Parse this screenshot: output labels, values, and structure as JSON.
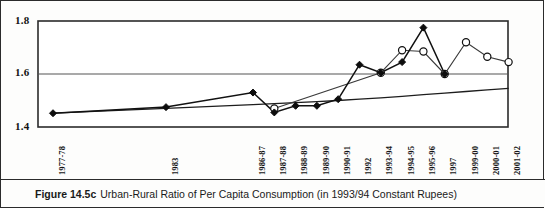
{
  "caption": {
    "figure_number": "Figure 14.5c",
    "text": "Urban-Rural Ratio of Per Capita Consumption (in 1993/94 Constant Rupees)"
  },
  "chart_data": {
    "type": "line",
    "title": "Urban-Rural Ratio of Per Capita Consumption (in 1993/94 Constant Rupees)",
    "xlabel": "",
    "ylabel": "",
    "ylim": [
      1.4,
      1.8
    ],
    "yticks": [
      1.4,
      1.6,
      1.8
    ],
    "ytick_labels": [
      "1.4",
      "1.6",
      "1.8"
    ],
    "grid": true,
    "legend": "none",
    "categories": [
      "1977-78",
      "1983",
      "1986-87",
      "1987-88",
      "1988-89",
      "1989-90",
      "1990-91",
      "1992",
      "1993-94",
      "1994-95",
      "1995-96",
      "1997",
      "1999-00",
      "2000-01",
      "2001-02"
    ],
    "series": [
      {
        "name": "Urban-Rural ratio (filled diamond)",
        "marker": "filled-diamond",
        "values": [
          1.452,
          1.475,
          1.53,
          1.455,
          1.48,
          1.48,
          1.505,
          1.635,
          1.605,
          1.645,
          1.775,
          1.6,
          null,
          null,
          null
        ]
      },
      {
        "name": "Urban-Rural ratio (open circle)",
        "marker": "open-circle",
        "values": [
          null,
          null,
          null,
          1.47,
          null,
          null,
          null,
          null,
          1.605,
          1.69,
          1.685,
          1.6,
          1.72,
          1.665,
          1.645
        ]
      },
      {
        "name": "Trend line",
        "marker": "none",
        "values": [
          1.452,
          1.47,
          1.484,
          1.488,
          1.492,
          1.496,
          1.5,
          1.505,
          1.51,
          1.516,
          1.522,
          1.528,
          1.534,
          1.54,
          1.546
        ]
      }
    ]
  }
}
